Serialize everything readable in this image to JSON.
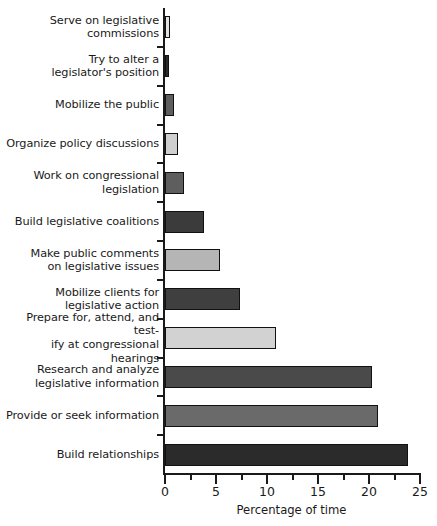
{
  "chart_data": {
    "type": "bar",
    "orientation": "horizontal",
    "title": "",
    "xlabel": "Percentage of time",
    "ylabel": "",
    "xlim": [
      0,
      25
    ],
    "grid": false,
    "legend": null,
    "xticks": [
      0,
      5,
      10,
      15,
      20,
      25
    ],
    "xtick_labels": [
      "0",
      "5",
      "10",
      "15",
      "20",
      "25"
    ],
    "xminor_ticks": [
      2.5,
      7.5,
      12.5,
      17.5,
      22.5
    ],
    "categories": [
      "Serve on legislative\ncommissions",
      "Try to alter a\nlegislator's position",
      "Mobilize the public",
      "Organize policy discussions",
      "Work on congressional\nlegislation",
      "Build legislative coalitions",
      "Make public comments\non legislative issues",
      "Mobilize clients for\nlegislative action",
      "Prepare for, attend, and test-\nify at congressional hearings",
      "Research and analyze\nlegislative information",
      "Provide or seek information",
      "Build relationships"
    ],
    "values": [
      0.5,
      0.4,
      0.9,
      1.3,
      1.9,
      3.8,
      5.4,
      7.4,
      10.9,
      20.3,
      20.9,
      23.8
    ],
    "bar_colors": [
      "#e2e2e2",
      "#2b2b2b",
      "#5e5e5e",
      "#cfcfcf",
      "#5e5e5e",
      "#3b3b3b",
      "#b5b5b5",
      "#3f3f3f",
      "#d2d2d2",
      "#4a4a4a",
      "#6a6a6a",
      "#2b2b2b"
    ]
  },
  "axis": {
    "x_title": "Percentage of time"
  },
  "colors": {
    "axis": "#1a1a1a",
    "text": "#1a1a1a",
    "background": "#ffffff",
    "bar_outline": "#111111"
  }
}
